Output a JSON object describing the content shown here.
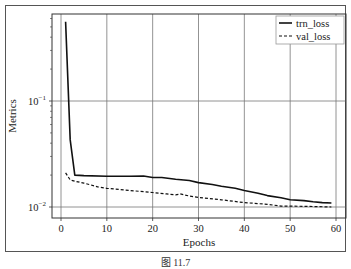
{
  "chart_data": {
    "type": "line",
    "title": "",
    "xlabel": "Epochs",
    "ylabel": "Metrics",
    "xlim": [
      -2,
      62
    ],
    "ylim": [
      0.0088,
      0.8
    ],
    "yscale": "log",
    "grid": true,
    "legend_position": "upper right",
    "x_ticks": [
      0,
      10,
      20,
      30,
      40,
      50,
      60
    ],
    "y_ticks": [
      {
        "value": 0.1,
        "label": "10^-1"
      },
      {
        "value": 0.01,
        "label": "10^-2"
      }
    ],
    "series": [
      {
        "name": "trn_loss",
        "style": "solid",
        "x": [
          1,
          2,
          3,
          5,
          10,
          15,
          18,
          20,
          22,
          25,
          28,
          30,
          33,
          35,
          38,
          40,
          43,
          45,
          48,
          50,
          53,
          55,
          57,
          59
        ],
        "values": [
          0.56,
          0.043,
          0.02,
          0.0198,
          0.0195,
          0.0195,
          0.0196,
          0.019,
          0.019,
          0.0183,
          0.0178,
          0.017,
          0.0163,
          0.0157,
          0.015,
          0.0143,
          0.0135,
          0.0128,
          0.0122,
          0.0117,
          0.0115,
          0.0112,
          0.011,
          0.0109
        ]
      },
      {
        "name": "val_loss",
        "style": "dashed",
        "x": [
          1,
          2,
          3,
          5,
          8,
          10,
          15,
          20,
          23,
          25,
          26,
          28,
          30,
          35,
          40,
          45,
          48,
          50,
          55,
          59
        ],
        "values": [
          0.021,
          0.018,
          0.0175,
          0.0168,
          0.0155,
          0.015,
          0.0143,
          0.0137,
          0.0133,
          0.013,
          0.0133,
          0.0127,
          0.0123,
          0.0117,
          0.011,
          0.0106,
          0.0102,
          0.0102,
          0.0101,
          0.01
        ]
      }
    ]
  },
  "caption": "图 11.7"
}
